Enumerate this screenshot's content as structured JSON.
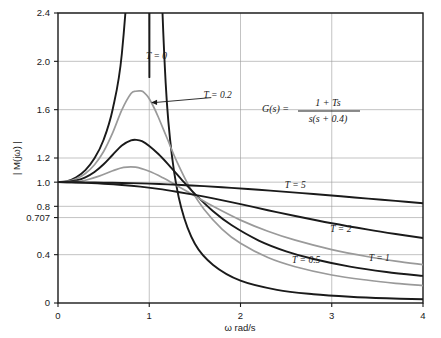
{
  "chart_data": {
    "type": "line",
    "title": "",
    "xlabel": "ω rad/s",
    "ylabel": "| M(jω) |",
    "xlim": [
      0,
      4
    ],
    "ylim": [
      0,
      2.4
    ],
    "grid": true,
    "legend_position": "inline-annotations",
    "xticks": [
      0,
      1,
      2,
      3,
      4
    ],
    "xtick_labels": [
      "0",
      "1",
      "2",
      "3",
      "4"
    ],
    "yticks": [
      0,
      0.4,
      0.707,
      0.8,
      1.0,
      1.2,
      1.6,
      2.0,
      2.4
    ],
    "ytick_labels": [
      "0",
      "0.4",
      "0.707",
      "0.8",
      "1.0",
      "1.2",
      "1.6",
      "2.0",
      "2.4"
    ],
    "annotation_formula": "G(s) = (1 + Ts) / (s(s + 0.4))",
    "formula_numerator": "1 + Ts",
    "formula_denominator": "s(s + 0.4)",
    "formula_lhs": "G(s) =",
    "series": [
      {
        "name": "T = 0",
        "label": "T = 0",
        "T": 0,
        "color": "#1a1a1a",
        "width": 1.9,
        "label_x": 1.08,
        "label_y": 2.02,
        "x": [
          0.0,
          0.1,
          0.2,
          0.3,
          0.4,
          0.5,
          0.6,
          0.7,
          0.8,
          0.85,
          0.9,
          0.93,
          0.96,
          0.98,
          1.0,
          1.02,
          1.05,
          1.08,
          1.12,
          1.18,
          1.25,
          1.35,
          1.5,
          1.7,
          2.0,
          2.4,
          2.8,
          3.2,
          3.6,
          4.0
        ],
        "y": [
          1.0,
          1.009,
          1.041,
          1.1,
          1.197,
          1.351,
          1.606,
          2.065,
          3.148,
          4.309,
          6.99,
          10.8,
          22.6,
          49.5,
          2.4,
          23.2,
          8.42,
          4.96,
          3.03,
          1.82,
          1.21,
          0.79,
          0.49,
          0.315,
          0.185,
          0.109,
          0.073,
          0.052,
          0.039,
          0.031
        ]
      },
      {
        "name": "T = 0.2",
        "label": "T = 0.2",
        "T": 0.2,
        "color": "#9a9a9a",
        "width": 1.7,
        "label_x": 1.75,
        "label_y": 1.7,
        "peak_omega": 0.93,
        "peak_value": 1.755,
        "x": [
          0.0,
          0.1,
          0.2,
          0.3,
          0.4,
          0.5,
          0.6,
          0.7,
          0.8,
          0.85,
          0.9,
          0.93,
          0.97,
          1.0,
          1.05,
          1.1,
          1.2,
          1.3,
          1.45,
          1.6,
          1.8,
          2.0,
          2.3,
          2.6,
          3.0,
          3.4,
          3.7,
          4.0
        ],
        "y": [
          1.0,
          1.006,
          1.028,
          1.072,
          1.144,
          1.254,
          1.41,
          1.598,
          1.733,
          1.752,
          1.755,
          1.75,
          1.721,
          1.69,
          1.62,
          1.537,
          1.355,
          1.175,
          0.948,
          0.776,
          0.61,
          0.494,
          0.376,
          0.3,
          0.232,
          0.188,
          0.163,
          0.144
        ]
      },
      {
        "name": "T = 0.5",
        "label": "T = 0.5",
        "T": 0.5,
        "color": "#1a1a1a",
        "width": 1.9,
        "label_x": 2.72,
        "label_y": 0.33,
        "peak_omega": 0.86,
        "peak_value": 1.35,
        "label_anchor": "middle",
        "x": [
          0.0,
          0.1,
          0.2,
          0.3,
          0.4,
          0.5,
          0.6,
          0.7,
          0.8,
          0.86,
          0.92,
          1.0,
          1.1,
          1.2,
          1.35,
          1.5,
          1.7,
          1.9,
          2.2,
          2.5,
          2.8,
          3.2,
          3.6,
          4.0
        ],
        "y": [
          1.0,
          1.002,
          1.014,
          1.04,
          1.084,
          1.148,
          1.227,
          1.304,
          1.345,
          1.35,
          1.339,
          1.3,
          1.233,
          1.154,
          1.026,
          0.903,
          0.759,
          0.645,
          0.517,
          0.428,
          0.364,
          0.301,
          0.257,
          0.224
        ]
      },
      {
        "name": "T = 1",
        "label": "T = 1",
        "T": 1,
        "color": "#9a9a9a",
        "width": 1.7,
        "label_x": 3.52,
        "label_y": 0.345,
        "peak_omega": 0.72,
        "peak_value": 1.125,
        "x": [
          0.0,
          0.1,
          0.2,
          0.3,
          0.45,
          0.6,
          0.72,
          0.85,
          1.0,
          1.15,
          1.3,
          1.5,
          1.7,
          2.0,
          2.3,
          2.6,
          3.0,
          3.4,
          3.7,
          4.0
        ],
        "y": [
          1.0,
          1.0,
          1.004,
          1.016,
          1.05,
          1.094,
          1.122,
          1.124,
          1.09,
          1.036,
          0.973,
          0.886,
          0.8,
          0.686,
          0.594,
          0.52,
          0.442,
          0.383,
          0.347,
          0.317
        ]
      },
      {
        "name": "T = 2",
        "label": "T = 2",
        "T": 2,
        "color": "#1a1a1a",
        "width": 1.9,
        "label_x": 3.1,
        "label_y": 0.59,
        "x": [
          0.0,
          0.15,
          0.3,
          0.5,
          0.7,
          0.9,
          1.1,
          1.3,
          1.5,
          1.7,
          2.0,
          2.3,
          2.6,
          3.0,
          3.4,
          3.7,
          4.0
        ],
        "y": [
          1.0,
          0.998,
          0.994,
          0.987,
          0.977,
          0.963,
          0.944,
          0.921,
          0.895,
          0.866,
          0.818,
          0.768,
          0.72,
          0.66,
          0.607,
          0.571,
          0.538
        ]
      },
      {
        "name": "T = 5",
        "label": "T = 5",
        "T": 5,
        "color": "#1a1a1a",
        "width": 1.9,
        "label_x": 2.6,
        "label_y": 0.955,
        "x": [
          0.0,
          0.2,
          0.4,
          0.6,
          0.8,
          1.0,
          1.2,
          1.4,
          1.6,
          1.9,
          2.2,
          2.5,
          2.8,
          3.1,
          3.4,
          3.7,
          4.0
        ],
        "y": [
          1.0,
          0.999,
          0.998,
          0.995,
          0.992,
          0.988,
          0.982,
          0.975,
          0.967,
          0.953,
          0.937,
          0.92,
          0.902,
          0.883,
          0.864,
          0.845,
          0.826
        ]
      }
    ],
    "annotations": [
      {
        "name": "t02-arrow",
        "text": "T = 0.2",
        "from_x": 1.68,
        "from_y": 1.7,
        "to_x": 1.02,
        "to_y": 1.66
      }
    ]
  },
  "colors": {
    "curve_dark": "#1a1a1a",
    "curve_gray": "#9a9a9a",
    "grid": "#9a9a9a",
    "frame": "#1a1a1a",
    "background": "#ffffff"
  }
}
